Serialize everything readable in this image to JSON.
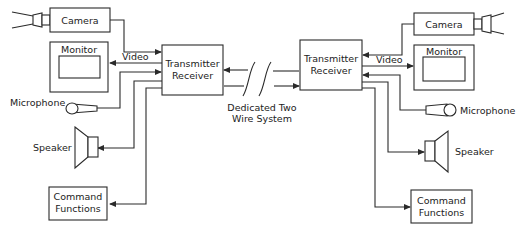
{
  "diagram": {
    "type": "block-diagram",
    "left_station": {
      "camera": "Camera",
      "monitor": "Monitor",
      "video": "Video",
      "transceiver_line1": "Transmitter",
      "transceiver_line2": "Receiver",
      "microphone": "Microphone",
      "speaker": "Speaker",
      "command_line1": "Command",
      "command_line2": "Functions"
    },
    "right_station": {
      "camera": "Camera",
      "monitor": "Monitor",
      "video": "Video",
      "transceiver_line1": "Transmitter",
      "transceiver_line2": "Receiver",
      "microphone": "Microphone",
      "speaker": "Speaker",
      "command_line1": "Command",
      "command_line2": "Functions"
    },
    "link": {
      "line1": "Dedicated Two",
      "line2": "Wire System"
    },
    "colors": {
      "line": "#2a2a2a",
      "background": "#ffffff"
    }
  }
}
